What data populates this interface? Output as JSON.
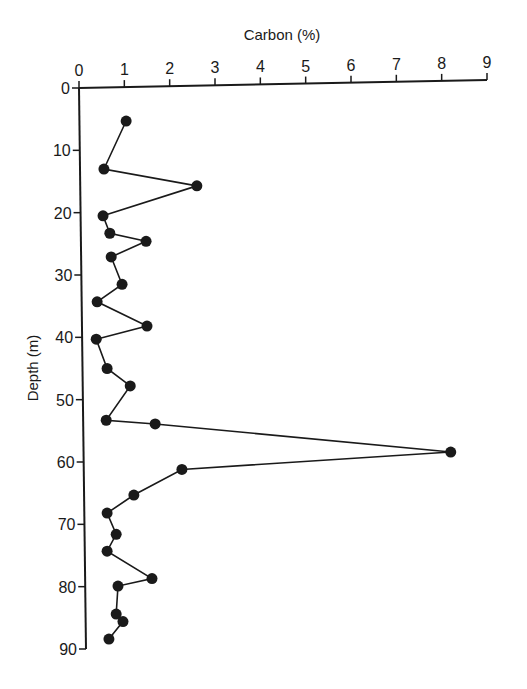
{
  "chart_data": {
    "type": "line",
    "title": "",
    "xlabel": "Carbon (%)",
    "ylabel": "Depth (m)",
    "x_axis_position": "top",
    "y_axis_inverted": true,
    "xlim": [
      0,
      9
    ],
    "ylim": [
      0,
      90
    ],
    "xticks": [
      "0",
      "1",
      "2",
      "3",
      "4",
      "5",
      "6",
      "7",
      "8",
      "9"
    ],
    "yticks": [
      "0",
      "10",
      "20",
      "30",
      "40",
      "50",
      "60",
      "70",
      "80",
      "90"
    ],
    "grid": false,
    "legend": null,
    "series": [
      {
        "name": "Carbon",
        "marker": "filled-circle",
        "color": "#1a1a1a",
        "points": [
          {
            "carbon": 1.04,
            "depth": 5.3
          },
          {
            "carbon": 0.55,
            "depth": 13.0
          },
          {
            "carbon": 2.6,
            "depth": 15.7
          },
          {
            "carbon": 0.53,
            "depth": 20.5
          },
          {
            "carbon": 0.68,
            "depth": 23.3
          },
          {
            "carbon": 1.48,
            "depth": 24.6
          },
          {
            "carbon": 0.71,
            "depth": 27.1
          },
          {
            "carbon": 0.95,
            "depth": 31.5
          },
          {
            "carbon": 0.4,
            "depth": 34.3
          },
          {
            "carbon": 1.5,
            "depth": 38.2
          },
          {
            "carbon": 0.38,
            "depth": 40.3
          },
          {
            "carbon": 0.62,
            "depth": 45.0
          },
          {
            "carbon": 1.13,
            "depth": 47.8
          },
          {
            "carbon": 0.6,
            "depth": 53.3
          },
          {
            "carbon": 1.68,
            "depth": 53.9
          },
          {
            "carbon": 8.2,
            "depth": 58.4
          },
          {
            "carbon": 2.27,
            "depth": 61.2
          },
          {
            "carbon": 1.21,
            "depth": 65.3
          },
          {
            "carbon": 0.62,
            "depth": 68.2
          },
          {
            "carbon": 0.82,
            "depth": 71.6
          },
          {
            "carbon": 0.62,
            "depth": 74.3
          },
          {
            "carbon": 1.61,
            "depth": 78.7
          },
          {
            "carbon": 0.86,
            "depth": 79.9
          },
          {
            "carbon": 0.82,
            "depth": 84.4
          },
          {
            "carbon": 0.97,
            "depth": 85.6
          },
          {
            "carbon": 0.66,
            "depth": 88.4
          }
        ]
      }
    ]
  }
}
